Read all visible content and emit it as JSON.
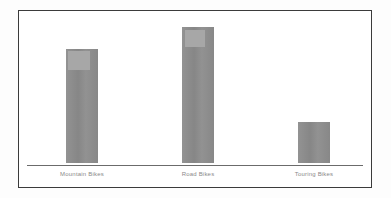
{
  "figure": {
    "background_color": "#fdfdfd",
    "frame_color": "#3b3b3b",
    "plot_background_color": "#ffffff",
    "axis_color": "#6b6b6b",
    "bar_color": "#8c8c8c",
    "bar_highlight_color": "#a7a7a7",
    "label_color": "#8a8a8a"
  },
  "chart_data": {
    "type": "bar",
    "title": "",
    "subtitle": "",
    "xlabel": "",
    "ylabel": "",
    "categories": [
      "Mountain Bikes",
      "Road Bikes",
      "Touring Bikes"
    ],
    "values": [
      122,
      145,
      44
    ],
    "ylim": [
      0,
      155
    ],
    "grid": false,
    "legend": null,
    "legend_position": "none",
    "annotations": [
      {
        "target_category": "Mountain Bikes",
        "kind": "highlight-block",
        "description": "lighter gray rectangle at top of bar"
      },
      {
        "target_category": "Road Bikes",
        "kind": "highlight-block",
        "description": "lighter gray rectangle at top of bar"
      }
    ],
    "series": [
      {
        "name": "Sales",
        "values": [
          122,
          145,
          44
        ]
      }
    ]
  }
}
